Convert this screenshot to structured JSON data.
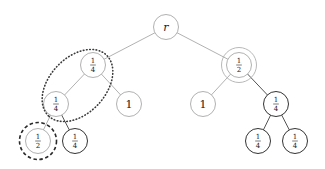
{
  "diagram": {
    "type": "binary-tree",
    "nodes": [
      {
        "id": "root",
        "label": "r",
        "kind": "var",
        "style": "light"
      },
      {
        "id": "n_l",
        "label": "1/4",
        "num": "1",
        "den": "4",
        "kind": "frac",
        "style": "light"
      },
      {
        "id": "n_r",
        "label": "1/2",
        "num": "1",
        "den": "2",
        "kind": "frac",
        "style": "light"
      },
      {
        "id": "n_ll",
        "label": "1/4",
        "num": "1",
        "den": "4",
        "kind": "frac",
        "style": "light"
      },
      {
        "id": "n_lr",
        "label": "1",
        "kind": "whole",
        "style": "light"
      },
      {
        "id": "n_rl",
        "label": "1",
        "kind": "whole",
        "style": "light"
      },
      {
        "id": "n_rr",
        "label": "1/4",
        "num": "1",
        "den": "4",
        "kind": "frac",
        "style": "dark"
      },
      {
        "id": "n_lll",
        "label": "1/2",
        "num": "1",
        "den": "2",
        "kind": "frac",
        "style": "light"
      },
      {
        "id": "n_llr",
        "label": "1/4",
        "num": "1",
        "den": "4",
        "kind": "frac",
        "style": "dark"
      },
      {
        "id": "n_rrl",
        "label": "1/4",
        "num": "1",
        "den": "4",
        "kind": "frac",
        "style": "dark"
      },
      {
        "id": "n_rrr",
        "label": "1/4",
        "num": "1",
        "den": "4",
        "kind": "frac",
        "style": "dark"
      }
    ],
    "edges": [
      {
        "from": "root",
        "to": "n_l",
        "style": "light"
      },
      {
        "from": "root",
        "to": "n_r",
        "style": "light"
      },
      {
        "from": "n_l",
        "to": "n_ll",
        "style": "light"
      },
      {
        "from": "n_l",
        "to": "n_lr",
        "style": "light"
      },
      {
        "from": "n_r",
        "to": "n_rl",
        "style": "light"
      },
      {
        "from": "n_r",
        "to": "n_rr",
        "style": "dark"
      },
      {
        "from": "n_ll",
        "to": "n_lll",
        "style": "light"
      },
      {
        "from": "n_ll",
        "to": "n_llr",
        "style": "dark"
      },
      {
        "from": "n_rr",
        "to": "n_rrl",
        "style": "dark"
      },
      {
        "from": "n_rr",
        "to": "n_rrr",
        "style": "dark"
      }
    ],
    "highlights": [
      {
        "name": "double-circle",
        "target": "n_r",
        "style": "double"
      },
      {
        "name": "dotted-ellipse",
        "targets": [
          "n_l",
          "n_ll"
        ],
        "style": "dotted"
      },
      {
        "name": "dashed-circle",
        "target": "n_lll",
        "style": "dashed"
      }
    ]
  }
}
